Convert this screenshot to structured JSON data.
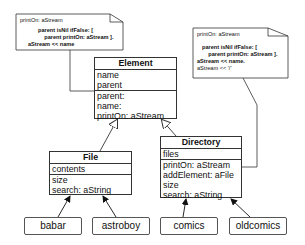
{
  "notes": {
    "left": {
      "signature": "printOn: aStream",
      "lines": [
        "parent isNil ifFalse: [",
        "    parent printOn: aStream ].",
        "aStream << name"
      ]
    },
    "right": {
      "signature": "printOn: aStream",
      "lines": [
        "parent isNil ifFalse: [",
        "    parent printOn: aStream ].",
        "aStream << name.",
        "aStream << '/'"
      ]
    }
  },
  "classes": {
    "element": {
      "name": "Element",
      "attributes": [
        "name",
        "parent"
      ],
      "methods": [
        "parent:",
        "name:",
        "printOn: aStream"
      ]
    },
    "file": {
      "name": "File",
      "attributes": [
        "contents"
      ],
      "methods": [
        "size",
        "search: aString"
      ]
    },
    "directory": {
      "name": "Directory",
      "attributes": [
        "files"
      ],
      "methods": [
        "printOn: aStream",
        "addElement: aFile",
        "size",
        "search: aString"
      ]
    }
  },
  "instances": [
    {
      "name": "babar",
      "class": "File"
    },
    {
      "name": "astroboy",
      "class": "File"
    },
    {
      "name": "comics",
      "class": "Directory"
    },
    {
      "name": "oldcomics",
      "class": "Directory"
    }
  ],
  "colors": {
    "line": "#333333",
    "background": "#ffffff"
  }
}
